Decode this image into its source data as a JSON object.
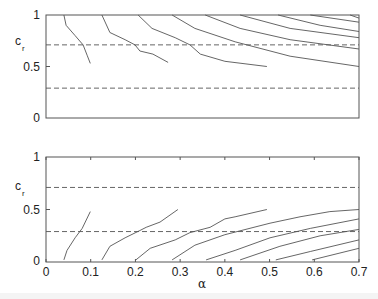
{
  "chart_data": [
    {
      "type": "line",
      "panel": "top",
      "title": "",
      "xlabel": "",
      "ylabel": "c_r",
      "xlim": [
        0,
        0.7
      ],
      "ylim": [
        0,
        1
      ],
      "yticks": [
        "0",
        "0.5",
        "1"
      ],
      "xticks": [],
      "reference_lines": [
        0.71,
        0.29
      ],
      "series": [
        {
          "name": "contour-1",
          "x": [
            0.04,
            0.045,
            0.065,
            0.083,
            0.092,
            0.099
          ],
          "y": [
            1.0,
            0.9,
            0.8,
            0.71,
            0.61,
            0.53
          ]
        },
        {
          "name": "contour-2",
          "x": [
            0.125,
            0.143,
            0.177,
            0.199,
            0.21,
            0.239,
            0.273
          ],
          "y": [
            1.0,
            0.83,
            0.76,
            0.71,
            0.65,
            0.62,
            0.54
          ]
        },
        {
          "name": "contour-3",
          "x": [
            0.206,
            0.237,
            0.289,
            0.322,
            0.345,
            0.4,
            0.494
          ],
          "y": [
            1.0,
            0.87,
            0.78,
            0.71,
            0.62,
            0.55,
            0.5
          ]
        },
        {
          "name": "contour-4",
          "x": [
            0.282,
            0.333,
            0.423,
            0.546,
            0.7
          ],
          "y": [
            1.0,
            0.87,
            0.74,
            0.6,
            0.5
          ]
        },
        {
          "name": "contour-5",
          "x": [
            0.356,
            0.434,
            0.546,
            0.7
          ],
          "y": [
            1.0,
            0.87,
            0.76,
            0.67
          ]
        },
        {
          "name": "contour-6",
          "x": [
            0.434,
            0.546,
            0.7
          ],
          "y": [
            1.0,
            0.87,
            0.78
          ]
        },
        {
          "name": "contour-7",
          "x": [
            0.519,
            0.613,
            0.7
          ],
          "y": [
            1.0,
            0.9,
            0.84
          ]
        },
        {
          "name": "contour-8",
          "x": [
            0.591,
            0.7
          ],
          "y": [
            1.0,
            0.93
          ]
        },
        {
          "name": "contour-9",
          "x": [
            0.68,
            0.7
          ],
          "y": [
            1.0,
            0.97
          ]
        }
      ]
    },
    {
      "type": "line",
      "panel": "bottom",
      "title": "",
      "xlabel": "α",
      "ylabel": "c_r",
      "xlim": [
        0,
        0.7
      ],
      "ylim": [
        0,
        1
      ],
      "yticks": [
        "0",
        "0.5",
        "1"
      ],
      "xticks": [
        "0",
        "0.1",
        "0.2",
        "0.3",
        "0.4",
        "0.5",
        "0.6",
        "0.7"
      ],
      "reference_lines": [
        0.71,
        0.29
      ],
      "series": [
        {
          "name": "contour-1",
          "x": [
            0.04,
            0.047,
            0.065,
            0.081,
            0.099
          ],
          "y": [
            0.02,
            0.11,
            0.23,
            0.32,
            0.48
          ]
        },
        {
          "name": "contour-2",
          "x": [
            0.125,
            0.143,
            0.177,
            0.21,
            0.224,
            0.255,
            0.295
          ],
          "y": [
            0.02,
            0.15,
            0.23,
            0.3,
            0.33,
            0.38,
            0.5
          ]
        },
        {
          "name": "contour-3",
          "x": [
            0.201,
            0.233,
            0.289,
            0.322,
            0.367,
            0.4,
            0.423,
            0.494
          ],
          "y": [
            0.02,
            0.13,
            0.21,
            0.28,
            0.33,
            0.41,
            0.43,
            0.5
          ]
        },
        {
          "name": "contour-4",
          "x": [
            0.282,
            0.333,
            0.4,
            0.501,
            0.568,
            0.635,
            0.7
          ],
          "y": [
            0.02,
            0.16,
            0.26,
            0.37,
            0.43,
            0.48,
            0.5
          ]
        },
        {
          "name": "contour-5",
          "x": [
            0.358,
            0.423,
            0.501,
            0.591,
            0.7
          ],
          "y": [
            0.02,
            0.11,
            0.23,
            0.32,
            0.41
          ]
        },
        {
          "name": "contour-6",
          "x": [
            0.434,
            0.523,
            0.613,
            0.7
          ],
          "y": [
            0.02,
            0.15,
            0.25,
            0.31
          ]
        },
        {
          "name": "contour-7",
          "x": [
            0.514,
            0.591,
            0.7
          ],
          "y": [
            0.02,
            0.1,
            0.21
          ]
        },
        {
          "name": "contour-8",
          "x": [
            0.595,
            0.7
          ],
          "y": [
            0.02,
            0.13
          ]
        }
      ]
    }
  ],
  "labels": {
    "top_ylabel_main": "c",
    "top_ylabel_sub": "r",
    "bottom_ylabel_main": "c",
    "bottom_ylabel_sub": "r",
    "xlabel": "α",
    "yticks": [
      "1",
      "0.5",
      "0"
    ],
    "xticks": [
      "0",
      "0.1",
      "0.2",
      "0.3",
      "0.4",
      "0.5",
      "0.6",
      "0.7"
    ]
  }
}
